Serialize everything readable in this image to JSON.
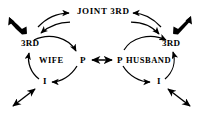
{
  "diagram": {
    "background_color": "#ffffff",
    "stroke_color": "#000000",
    "labels": {
      "joint_third": "JOINT  3RD",
      "third_left": "3RD",
      "third_right": "3RD",
      "wife": "WIFE",
      "husband": "HUSBAND",
      "p_left": "P",
      "p_right": "P",
      "i_left": "I",
      "i_right": "I"
    },
    "nodes": [
      {
        "id": "joint-3rd",
        "label": "JOINT  3RD",
        "x": 100,
        "y": 12
      },
      {
        "id": "third-left",
        "label": "3RD",
        "x": 31,
        "y": 44
      },
      {
        "id": "third-right",
        "label": "3RD",
        "x": 171,
        "y": 44
      },
      {
        "id": "wife",
        "label": "WIFE",
        "x": 51,
        "y": 61
      },
      {
        "id": "p-left",
        "label": "P",
        "x": 83,
        "y": 61
      },
      {
        "id": "p-right",
        "label": "P",
        "x": 119,
        "y": 61
      },
      {
        "id": "husband",
        "label": "HUSBAND",
        "x": 149,
        "y": 61
      },
      {
        "id": "i-left",
        "label": "I",
        "x": 46,
        "y": 82
      },
      {
        "id": "i-right",
        "label": "I",
        "x": 160,
        "y": 82
      }
    ],
    "edges": [
      {
        "id": "wife-cycle-3rd-to-p",
        "from": "third-left",
        "to": "p-left",
        "style": "curved-arrow"
      },
      {
        "id": "wife-cycle-p-to-i",
        "from": "p-left",
        "to": "i-left",
        "style": "curved-arrow"
      },
      {
        "id": "wife-cycle-i-to-3rd",
        "from": "i-left",
        "to": "third-left",
        "style": "curved-arrow"
      },
      {
        "id": "husband-cycle-3rd-to-p",
        "from": "third-right",
        "to": "p-right",
        "style": "curved-arrow"
      },
      {
        "id": "husband-cycle-p-to-i",
        "from": "p-right",
        "to": "i-right",
        "style": "curved-arrow"
      },
      {
        "id": "husband-cycle-i-to-3rd",
        "from": "i-right",
        "to": "third-right",
        "style": "curved-arrow"
      },
      {
        "id": "p-to-p",
        "from": "p-left",
        "to": "p-right",
        "style": "double-headed-arrow"
      },
      {
        "id": "joint-to-wife-3rd",
        "from": "joint-3rd",
        "to": "third-left",
        "style": "curved-arrow"
      },
      {
        "id": "wife-3rd-to-joint",
        "from": "third-left",
        "to": "joint-3rd",
        "style": "curved-arrow"
      },
      {
        "id": "joint-to-husband-3rd",
        "from": "joint-3rd",
        "to": "third-right",
        "style": "curved-arrow"
      },
      {
        "id": "husband-3rd-to-joint",
        "from": "third-right",
        "to": "joint-3rd",
        "style": "curved-arrow"
      }
    ],
    "external_arrows": [
      {
        "id": "external-top-left",
        "style": "thick-double-headed-diagonal",
        "direction": "nw-se"
      },
      {
        "id": "external-top-right",
        "style": "thick-double-headed-diagonal",
        "direction": "ne-sw"
      },
      {
        "id": "external-bottom-left",
        "style": "thin-double-headed-diagonal",
        "direction": "nw-se"
      },
      {
        "id": "external-bottom-right",
        "style": "thin-double-headed-diagonal",
        "direction": "ne-sw"
      }
    ]
  }
}
